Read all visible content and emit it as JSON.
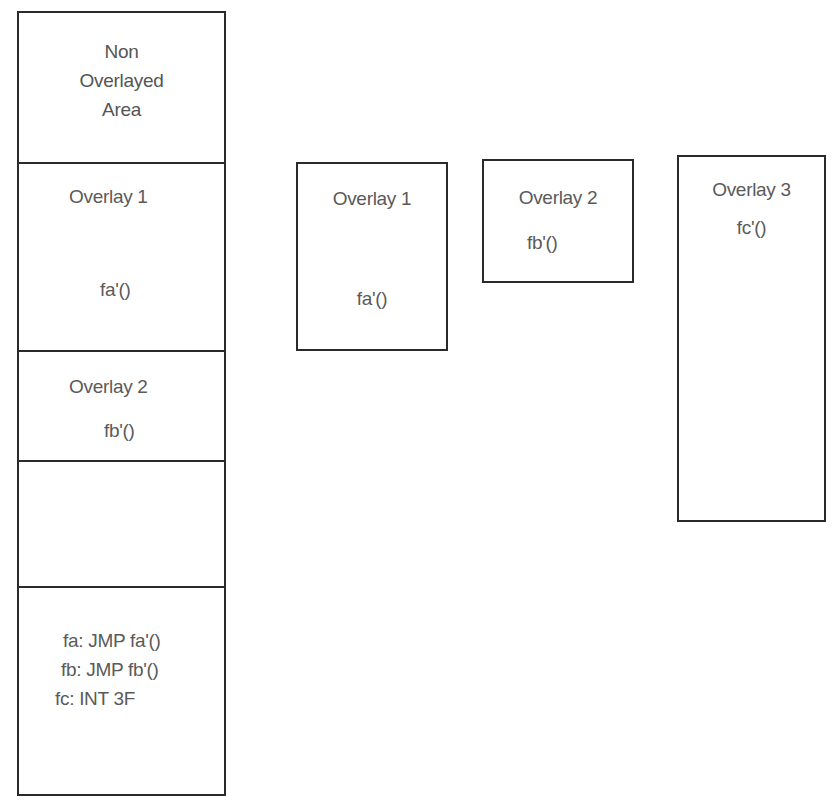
{
  "memory_column": {
    "non_overlayed": {
      "lines": [
        "Non",
        "Overlayed",
        "Area"
      ]
    },
    "overlay1_slot": {
      "title": "Overlay 1",
      "func": "fa'()"
    },
    "overlay2_slot": {
      "title": "Overlay 2",
      "func": "fb'()"
    },
    "empty_slot": {},
    "stub_area": {
      "lines": [
        "fa: JMP fa'()",
        "fb: JMP fb'()",
        "fc: INT 3F"
      ]
    }
  },
  "overlays": [
    {
      "title": "Overlay 1",
      "func": "fa'()"
    },
    {
      "title": "Overlay 2",
      "func": "fb'()"
    },
    {
      "title": "Overlay 3",
      "func": "fc'()"
    }
  ],
  "colors": {
    "line": "#2a2a2a",
    "text": "#5a5a5a",
    "background": "#ffffff"
  }
}
